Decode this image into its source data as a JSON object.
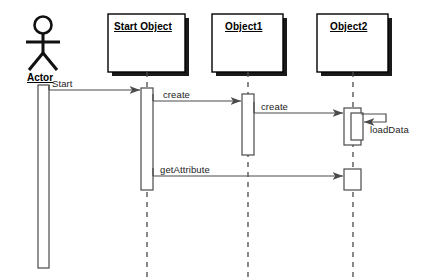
{
  "diagram": {
    "type": "uml-sequence-diagram",
    "background": "#ffffff",
    "line_color": "#4a4a4a",
    "box_fill": "#ffffff",
    "box_stroke": "#000000",
    "shadow_color": "#1a1a1a",
    "text_color": "#111111"
  },
  "actor": {
    "name": "Actor",
    "lifeline_x": 43
  },
  "participants": [
    {
      "name": "Start Object",
      "lifeline_x": 147,
      "box": {
        "x": 108,
        "y": 14,
        "w": 77,
        "h": 58
      }
    },
    {
      "name": "Object1",
      "lifeline_x": 248,
      "box": {
        "x": 212,
        "y": 14,
        "w": 71,
        "h": 58
      }
    },
    {
      "name": "Object2",
      "lifeline_x": 353,
      "box": {
        "x": 317,
        "y": 14,
        "w": 71,
        "h": 58
      }
    }
  ],
  "messages": [
    {
      "label": "Start",
      "from": "Actor",
      "to": "Start Object",
      "y": 90,
      "kind": "call"
    },
    {
      "label": "create",
      "from": "Start Object",
      "to": "Object1",
      "y": 101,
      "kind": "call"
    },
    {
      "label": "create",
      "from": "Object1",
      "to": "Object2",
      "y": 113,
      "kind": "call"
    },
    {
      "label": "loadData",
      "from": "Object2",
      "to": "Object2",
      "y": 120,
      "kind": "self-call"
    },
    {
      "label": "getAttribute",
      "from": "Start Object",
      "to": "Object2",
      "y": 176,
      "kind": "call"
    }
  ],
  "activations": [
    {
      "owner": "Actor",
      "x": 38,
      "y": 85,
      "w": 11,
      "h": 183
    },
    {
      "owner": "Start Object",
      "x": 141,
      "y": 88,
      "w": 12,
      "h": 102
    },
    {
      "owner": "Object1",
      "x": 242,
      "y": 94,
      "w": 12,
      "h": 61
    },
    {
      "owner": "Object2",
      "x": 344,
      "y": 108,
      "w": 17,
      "h": 37
    },
    {
      "owner": "Object2",
      "x": 351,
      "y": 113,
      "w": 12,
      "h": 27
    },
    {
      "owner": "Object2",
      "x": 344,
      "y": 169,
      "w": 17,
      "h": 21
    }
  ]
}
